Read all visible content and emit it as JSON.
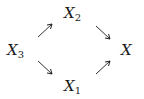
{
  "diagram": {
    "type": "commutative-diagram",
    "nodes": [
      {
        "id": "X3",
        "base": "X",
        "subscript": "3",
        "position": "left"
      },
      {
        "id": "X2",
        "base": "X",
        "subscript": "2",
        "position": "top"
      },
      {
        "id": "X1",
        "base": "X",
        "subscript": "1",
        "position": "bottom"
      },
      {
        "id": "X",
        "base": "X",
        "subscript": "",
        "position": "right"
      }
    ],
    "edges": [
      {
        "from": "X3",
        "to": "X2",
        "direction": "north-east"
      },
      {
        "from": "X2",
        "to": "X",
        "direction": "south-east"
      },
      {
        "from": "X3",
        "to": "X1",
        "direction": "south-east"
      },
      {
        "from": "X1",
        "to": "X",
        "direction": "north-east"
      }
    ],
    "colors": {
      "ink": "#1a1a1a",
      "background": "#ffffff"
    }
  }
}
